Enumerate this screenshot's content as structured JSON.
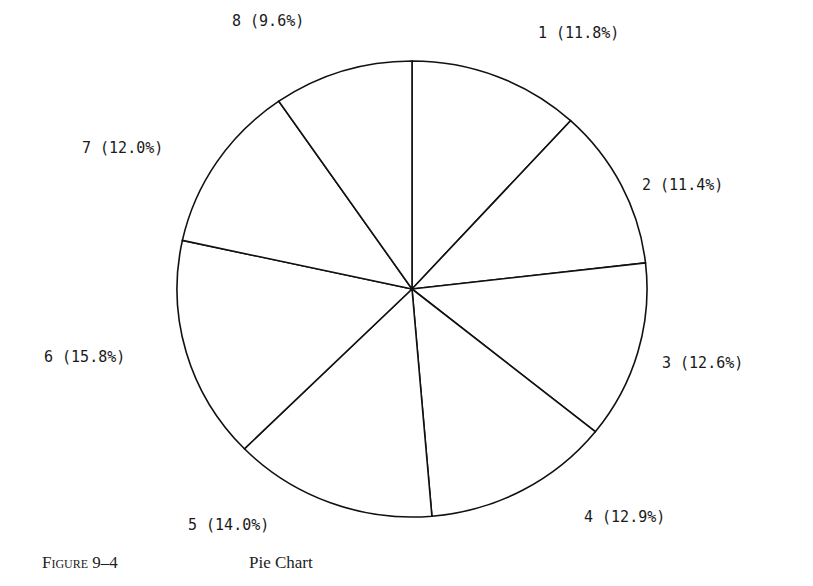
{
  "chart_data": {
    "type": "pie",
    "title": "Pie Chart",
    "figure_label": "Figure 9–4",
    "start_angle_deg": 90,
    "direction": "clockwise",
    "categories": [
      "1",
      "2",
      "3",
      "4",
      "5",
      "6",
      "7",
      "8"
    ],
    "values": [
      11.8,
      11.4,
      12.6,
      12.9,
      14.0,
      15.8,
      12.0,
      9.6
    ],
    "labels": [
      "1 (11.8%)",
      "2 (11.4%)",
      "3 (12.6%)",
      "4 (12.9%)",
      "5 (14.0%)",
      "6 (15.8%)",
      "7 (12.0%)",
      "8 (9.6%)"
    ],
    "fill": "#ffffff",
    "stroke": "#111111",
    "legend": "none"
  },
  "caption": {
    "figure": "Figure 9–4",
    "title": "Pie Chart"
  }
}
